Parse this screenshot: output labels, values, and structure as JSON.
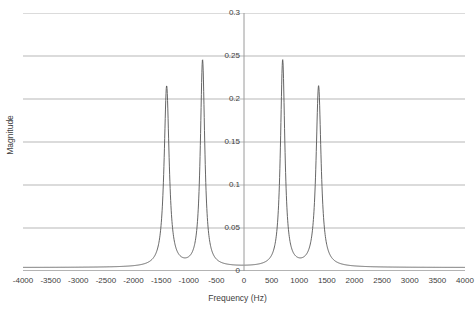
{
  "chart_data": {
    "type": "line",
    "title": "",
    "xlabel": "Frequency (Hz)",
    "ylabel": "Magnitude",
    "xlim": [
      -4000,
      4000
    ],
    "ylim": [
      0,
      0.3
    ],
    "grid": true,
    "legend": false,
    "xticks": [
      -4000,
      -3500,
      -3000,
      -2500,
      -2000,
      -1500,
      -1000,
      -500,
      0,
      500,
      1000,
      1500,
      2000,
      2500,
      3000,
      3500,
      4000
    ],
    "xtick_labels": [
      "-4000",
      "-3500",
      "-3000",
      "-2500",
      "-2000",
      "-1500",
      "-1000",
      "-500",
      "0",
      "500",
      "1000",
      "1500",
      "2000",
      "2500",
      "3000",
      "3500",
      "4000"
    ],
    "yticks": [
      0,
      0.05,
      0.1,
      0.15,
      0.2,
      0.25,
      0.3
    ],
    "ytick_labels": [
      "0",
      "0.05",
      "0.1",
      "0.15",
      "0.2",
      "0.25",
      "0.3"
    ],
    "series": [
      {
        "name": "magnitude-spectrum",
        "color": "#555555",
        "peaks": [
          {
            "center": -1400,
            "amplitude": 0.21,
            "halfwidth": 55
          },
          {
            "center": -750,
            "amplitude": 0.24,
            "halfwidth": 48
          },
          {
            "center": 700,
            "amplitude": 0.24,
            "halfwidth": 48
          },
          {
            "center": 1350,
            "amplitude": 0.21,
            "halfwidth": 55
          }
        ],
        "baseline": 0.004,
        "notes": "Four Lorentzian resonance peaks, symmetric about 0 Hz; valleys between inner peaks dip to about 0.018 and between each outer/inner pair to about 0.035"
      },
      {
        "name": "zero-reference",
        "color": "#b0b0b0",
        "constant": 0.0
      }
    ]
  },
  "axes": {
    "x_axis_title": "Frequency (Hz)",
    "y_axis_title": "Magnitude"
  }
}
